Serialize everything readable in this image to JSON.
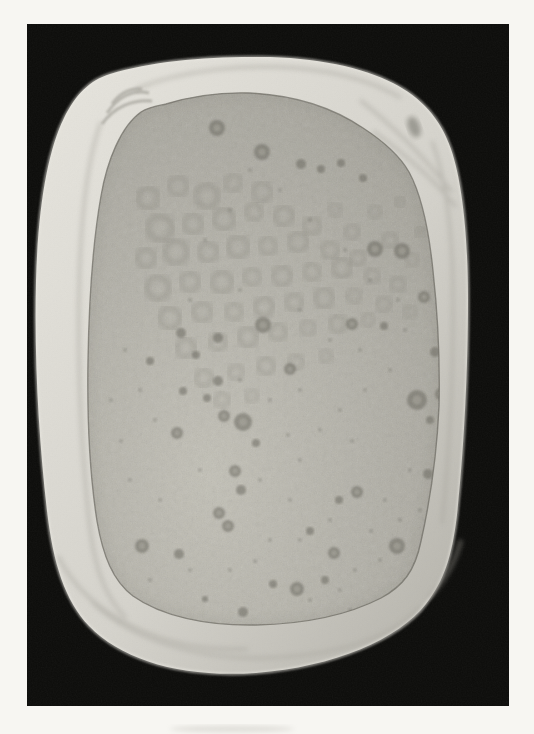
{
  "page": {
    "background": "#f7f6f2"
  },
  "figure": {
    "frame": {
      "x": 27,
      "y": 24,
      "width": 482,
      "height": 682
    },
    "colors": {
      "photo_background": "#0c0c0a",
      "cloth_light": "#e7e5de",
      "cloth_mid": "#d5d3cc",
      "cloth_shadow": "#b2b0a8",
      "skin_light": "#c3c1b7",
      "skin_base": "#b2b0a7",
      "skin_dark": "#a19f96",
      "lesion": "#6b6960",
      "mottle": "#817f76",
      "edge_line": "#55534b",
      "smudge": "#4a483f",
      "bleed": "#cbc9c3"
    },
    "lesions": [
      [
        217,
        128,
        8
      ],
      [
        262,
        152,
        8
      ],
      [
        301,
        164,
        5
      ],
      [
        321,
        169,
        4
      ],
      [
        341,
        163,
        4
      ],
      [
        363,
        178,
        4
      ],
      [
        375,
        249,
        8
      ],
      [
        402,
        251,
        8
      ],
      [
        424,
        297,
        6
      ],
      [
        352,
        324,
        6
      ],
      [
        384,
        326,
        4
      ],
      [
        263,
        325,
        8
      ],
      [
        290,
        369,
        6
      ],
      [
        218,
        338,
        5
      ],
      [
        181,
        333,
        5
      ],
      [
        150,
        361,
        4
      ],
      [
        196,
        355,
        4
      ],
      [
        218,
        381,
        5
      ],
      [
        183,
        391,
        4
      ],
      [
        207,
        398,
        4
      ],
      [
        243,
        422,
        9
      ],
      [
        224,
        416,
        6
      ],
      [
        177,
        433,
        6
      ],
      [
        256,
        443,
        4
      ],
      [
        235,
        471,
        6
      ],
      [
        241,
        490,
        5
      ],
      [
        219,
        513,
        6
      ],
      [
        228,
        526,
        6
      ],
      [
        142,
        546,
        7
      ],
      [
        179,
        554,
        5
      ],
      [
        357,
        492,
        6
      ],
      [
        339,
        500,
        4
      ],
      [
        334,
        553,
        6
      ],
      [
        397,
        546,
        8
      ],
      [
        417,
        400,
        10
      ],
      [
        428,
        474,
        5
      ],
      [
        435,
        352,
        5
      ],
      [
        441,
        394,
        6
      ],
      [
        430,
        420,
        4
      ],
      [
        297,
        589,
        7
      ],
      [
        273,
        584,
        4
      ],
      [
        243,
        612,
        5
      ],
      [
        205,
        599,
        3
      ],
      [
        310,
        531,
        4
      ],
      [
        325,
        580,
        4
      ]
    ],
    "mottle_rings": [
      [
        148,
        198,
        10
      ],
      [
        178,
        186,
        9
      ],
      [
        207,
        196,
        11
      ],
      [
        233,
        183,
        8
      ],
      [
        262,
        192,
        9
      ],
      [
        160,
        228,
        12
      ],
      [
        193,
        224,
        9
      ],
      [
        224,
        219,
        10
      ],
      [
        254,
        212,
        8
      ],
      [
        284,
        216,
        9
      ],
      [
        312,
        226,
        8
      ],
      [
        146,
        258,
        9
      ],
      [
        176,
        252,
        11
      ],
      [
        208,
        252,
        9
      ],
      [
        238,
        247,
        10
      ],
      [
        268,
        246,
        8
      ],
      [
        298,
        242,
        9
      ],
      [
        330,
        250,
        8
      ],
      [
        358,
        258,
        7
      ],
      [
        158,
        288,
        11
      ],
      [
        190,
        282,
        9
      ],
      [
        222,
        282,
        10
      ],
      [
        252,
        277,
        8
      ],
      [
        282,
        276,
        9
      ],
      [
        312,
        272,
        8
      ],
      [
        342,
        268,
        9
      ],
      [
        372,
        276,
        7
      ],
      [
        398,
        284,
        7
      ],
      [
        170,
        318,
        10
      ],
      [
        202,
        312,
        9
      ],
      [
        234,
        312,
        8
      ],
      [
        264,
        307,
        9
      ],
      [
        294,
        302,
        8
      ],
      [
        324,
        298,
        9
      ],
      [
        354,
        296,
        7
      ],
      [
        384,
        304,
        7
      ],
      [
        410,
        312,
        6
      ],
      [
        186,
        348,
        9
      ],
      [
        218,
        342,
        8
      ],
      [
        248,
        337,
        9
      ],
      [
        278,
        332,
        8
      ],
      [
        308,
        328,
        7
      ],
      [
        338,
        324,
        8
      ],
      [
        368,
        320,
        6
      ],
      [
        204,
        378,
        8
      ],
      [
        236,
        372,
        7
      ],
      [
        266,
        366,
        8
      ],
      [
        296,
        362,
        7
      ],
      [
        326,
        356,
        6
      ],
      [
        222,
        400,
        7
      ],
      [
        252,
        396,
        6
      ],
      [
        390,
        240,
        7
      ],
      [
        412,
        260,
        6
      ],
      [
        420,
        232,
        5
      ],
      [
        400,
        202,
        5
      ],
      [
        375,
        212,
        6
      ],
      [
        352,
        232,
        7
      ],
      [
        335,
        210,
        6
      ]
    ],
    "specks": [
      [
        300,
        460
      ],
      [
        320,
        430
      ],
      [
        352,
        441
      ],
      [
        290,
        500
      ],
      [
        270,
        540
      ],
      [
        255,
        561
      ],
      [
        355,
        570
      ],
      [
        371,
        531
      ],
      [
        385,
        500
      ],
      [
        260,
        480
      ],
      [
        200,
        470
      ],
      [
        160,
        500
      ],
      [
        130,
        480
      ],
      [
        121,
        441
      ],
      [
        111,
        400
      ],
      [
        288,
        435
      ],
      [
        340,
        410
      ],
      [
        365,
        390
      ],
      [
        390,
        370
      ],
      [
        405,
        330
      ],
      [
        398,
        300
      ],
      [
        370,
        280
      ],
      [
        345,
        250
      ],
      [
        310,
        220
      ],
      [
        280,
        190
      ],
      [
        250,
        170
      ],
      [
        230,
        210
      ],
      [
        205,
        240
      ],
      [
        190,
        300
      ],
      [
        240,
        290
      ],
      [
        300,
        310
      ],
      [
        330,
        340
      ],
      [
        360,
        350
      ],
      [
        300,
        390
      ],
      [
        270,
        400
      ],
      [
        240,
        380
      ],
      [
        350,
        610
      ],
      [
        310,
        600
      ],
      [
        230,
        570
      ],
      [
        190,
        570
      ],
      [
        150,
        580
      ],
      [
        410,
        470
      ],
      [
        420,
        510
      ],
      [
        400,
        520
      ],
      [
        380,
        560
      ],
      [
        340,
        590
      ],
      [
        155,
        420
      ],
      [
        140,
        390
      ],
      [
        125,
        350
      ],
      [
        300,
        540
      ],
      [
        330,
        520
      ]
    ],
    "cloth_smudge": {
      "x": 414,
      "y": 127,
      "rx": 6,
      "ry": 11,
      "rotate": -20,
      "opacity": 0.42
    },
    "bleed_smudge": {
      "x": 232,
      "y": 729,
      "rx": 62,
      "ry": 3.5,
      "opacity": 0.5
    }
  }
}
